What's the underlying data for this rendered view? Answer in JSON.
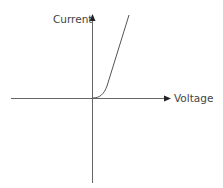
{
  "diagram": {
    "type": "iv-characteristic-curve",
    "axes": {
      "y_label": "Current",
      "x_label": "Voltage"
    },
    "colors": {
      "axis": "#666666",
      "curve": "#555555",
      "text": "#444444"
    }
  }
}
